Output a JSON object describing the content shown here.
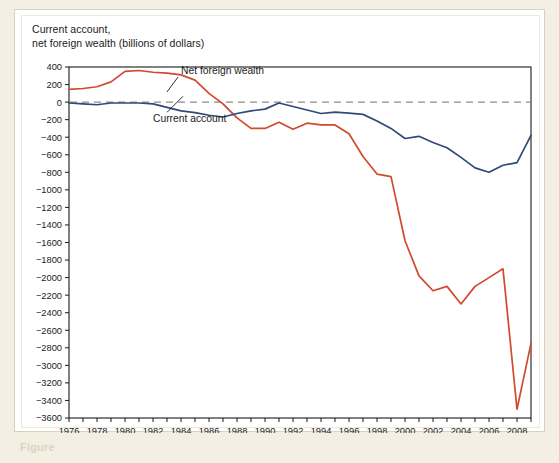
{
  "figure": {
    "axis_title": "Current account,\nnet foreign wealth (billions of dollars)",
    "bottom_caption": "Figure"
  },
  "colors": {
    "page_background": "#f3efe2",
    "card_background": "#ffffff",
    "card_border": "#d8d2bd",
    "axis": "#1b1b1b",
    "net_foreign_wealth": "#cf4a2e",
    "current_account": "#2f4a78",
    "zero_line": "#8c8c8c"
  },
  "chart_data": {
    "type": "line",
    "title": "Current account, net foreign wealth (billions of dollars)",
    "xlabel": "",
    "ylabel": "billions of dollars",
    "xlim": [
      1976,
      2009
    ],
    "ylim": [
      -3600,
      400
    ],
    "ytick_step": 200,
    "xtick_step": 1,
    "xlabel_step": 2,
    "grid": false,
    "legend": "inline-annotations",
    "zero_reference_line": 0,
    "yticks": [
      400,
      200,
      0,
      -200,
      -400,
      -600,
      -800,
      -1000,
      -1200,
      -1400,
      -1600,
      -1800,
      -2000,
      -2200,
      -2400,
      -2600,
      -2800,
      -3000,
      -3200,
      -3400,
      -3600
    ],
    "ytick_labels": [
      "400",
      "200",
      "0",
      "−200",
      "−400",
      "−600",
      "−800",
      "−1000",
      "−1200",
      "−1400",
      "−1600",
      "−1800",
      "−2000",
      "−2200",
      "−2400",
      "−2600",
      "−2800",
      "−3000",
      "−3200",
      "−3400",
      "−3600"
    ],
    "xticks": [
      1976,
      1977,
      1978,
      1979,
      1980,
      1981,
      1982,
      1983,
      1984,
      1985,
      1986,
      1987,
      1988,
      1989,
      1990,
      1991,
      1992,
      1993,
      1994,
      1995,
      1996,
      1997,
      1998,
      1999,
      2000,
      2001,
      2002,
      2003,
      2004,
      2005,
      2006,
      2007,
      2008,
      2009
    ],
    "xtick_labels": [
      "1976",
      "1978",
      "1980",
      "1982",
      "1984",
      "1986",
      "1988",
      "1990",
      "1992",
      "1994",
      "1996",
      "1998",
      "2000",
      "2002",
      "2004",
      "2006",
      "2008"
    ],
    "xtick_label_years": [
      1976,
      1978,
      1980,
      1982,
      1984,
      1986,
      1988,
      1990,
      1992,
      1994,
      1996,
      1998,
      2000,
      2002,
      2004,
      2006,
      2008
    ],
    "x": [
      1976,
      1977,
      1978,
      1979,
      1980,
      1981,
      1982,
      1983,
      1984,
      1985,
      1986,
      1987,
      1988,
      1989,
      1990,
      1991,
      1992,
      1993,
      1994,
      1995,
      1996,
      1997,
      1998,
      1999,
      2000,
      2001,
      2002,
      2003,
      2004,
      2005,
      2006,
      2007,
      2008,
      2009
    ],
    "series": [
      {
        "name": "Net foreign wealth",
        "color": "#cf4a2e",
        "label_x": 1984,
        "label_y": 320,
        "values": [
          145,
          155,
          175,
          230,
          350,
          360,
          340,
          330,
          310,
          250,
          100,
          -20,
          -180,
          -300,
          -300,
          -230,
          -310,
          -240,
          -260,
          -260,
          -360,
          -620,
          -820,
          -850,
          -1580,
          -1980,
          -2150,
          -2100,
          -2300,
          -2100,
          -2000,
          -1900,
          -3500,
          -2750
        ]
      },
      {
        "name": "Current account",
        "color": "#2f4a78",
        "label_x": 1982,
        "label_y": -230,
        "values": [
          -10,
          -20,
          -30,
          -10,
          -10,
          -10,
          -20,
          -60,
          -100,
          -120,
          -150,
          -170,
          -130,
          -100,
          -80,
          -10,
          -50,
          -90,
          -130,
          -115,
          -125,
          -140,
          -215,
          -300,
          -415,
          -390,
          -460,
          -520,
          -630,
          -750,
          -800,
          -720,
          -690,
          -380
        ]
      }
    ],
    "annotations": [
      {
        "text": "Net foreign wealth",
        "target_year": 1985,
        "target_value": 230
      },
      {
        "text": "Current account",
        "target_year": 1983,
        "target_value": -60
      }
    ]
  }
}
